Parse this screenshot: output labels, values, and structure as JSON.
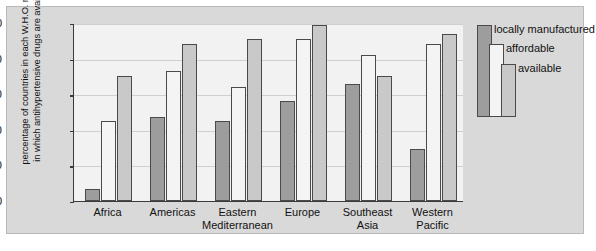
{
  "chart_data": {
    "type": "bar",
    "title": "",
    "subtitle": "",
    "xlabel": "",
    "ylabel": "percentage of countries in each W.H.O. region in which antihypertensive drugs are available",
    "ylabel_line1": "percentage of countries in each W.H.O. region",
    "ylabel_line2": "in which antihypertensive drugs are available",
    "ylim": [
      0,
      100
    ],
    "yticks": [
      0,
      20,
      40,
      60,
      80,
      100
    ],
    "ytick_labels": [
      "0",
      "20",
      "40",
      "60",
      "80",
      "100"
    ],
    "grid": true,
    "legend_position": "right",
    "categories": [
      "Africa",
      "Americas",
      "Eastern Mediterranean",
      "Europe",
      "Southeast Asia",
      "Western Pacific"
    ],
    "category_lines": [
      [
        "Africa"
      ],
      [
        "Americas"
      ],
      [
        "Eastern",
        "Mediterranean"
      ],
      [
        "Europe"
      ],
      [
        "Southeast",
        "Asia"
      ],
      [
        "Western",
        "Pacific"
      ]
    ],
    "series": [
      {
        "name": "locally manufactured",
        "color": "#9d9d9d",
        "values": [
          7,
          47,
          45,
          56,
          66,
          29
        ]
      },
      {
        "name": "affordable",
        "color": "#f4f4f4",
        "values": [
          45,
          73,
          64,
          91,
          82,
          88
        ]
      },
      {
        "name": "available",
        "color": "#c9c9c9",
        "values": [
          70,
          88,
          91,
          99,
          70,
          94
        ]
      }
    ]
  },
  "legend": {
    "items": [
      {
        "label": "locally manufactured",
        "color": "#9d9d9d"
      },
      {
        "label": "affordable",
        "color": "#f4f4f4"
      },
      {
        "label": "available",
        "color": "#c9c9c9"
      }
    ]
  },
  "colors": {
    "figure_background": "#d9d9d9",
    "plot_background": "#f2f2f2",
    "axis": "#3a3a3a",
    "gridline": "#cfcfcf",
    "bar_outline": "#4a4a4a"
  }
}
